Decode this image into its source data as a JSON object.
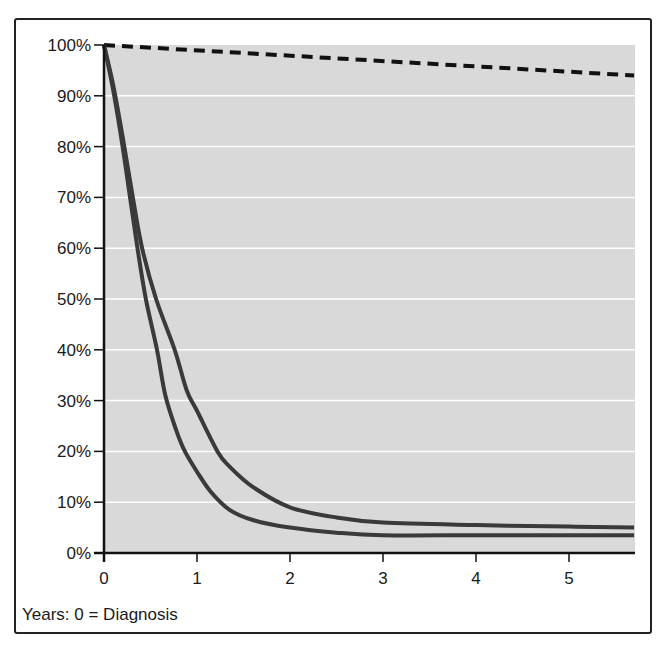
{
  "chart_data": {
    "type": "line",
    "title": "",
    "xlabel": "Years: 0 = Diagnosis",
    "ylabel": "",
    "xlim": [
      0,
      5.7
    ],
    "ylim": [
      0,
      100
    ],
    "x_ticks": [
      0,
      1,
      2,
      3,
      4,
      5
    ],
    "x_tick_labels": [
      "0",
      "1",
      "2",
      "3",
      "4",
      "5"
    ],
    "y_ticks": [
      0,
      10,
      20,
      30,
      40,
      50,
      60,
      70,
      80,
      90,
      100
    ],
    "y_tick_labels": [
      "0%",
      "10%",
      "20%",
      "30%",
      "40%",
      "50%",
      "60%",
      "70%",
      "80%",
      "90%",
      "100%"
    ],
    "grid": {
      "horizontal": true,
      "vertical": false,
      "color": "#ffffff"
    },
    "legend": null,
    "plot_background": "#d9d9d9",
    "series": [
      {
        "name": "reference (dashed)",
        "style": "dashed",
        "color": "#111111",
        "x": [
          0,
          5.7
        ],
        "y": [
          100,
          94
        ]
      },
      {
        "name": "upper curve",
        "style": "solid",
        "color": "#3a3a3a",
        "x": [
          0,
          0.1,
          0.2,
          0.31,
          0.41,
          0.56,
          0.76,
          0.89,
          1.0,
          1.22,
          1.35,
          1.6,
          2.0,
          2.5,
          3.0,
          4.0,
          5.0,
          5.7
        ],
        "y": [
          100,
          92,
          82,
          70,
          60,
          50,
          40,
          32,
          28,
          20,
          17,
          13,
          9,
          7,
          6,
          5.5,
          5.2,
          5
        ]
      },
      {
        "name": "lower curve",
        "style": "solid",
        "color": "#3a3a3a",
        "x": [
          0,
          0.1,
          0.2,
          0.28,
          0.36,
          0.45,
          0.57,
          0.66,
          0.78,
          0.87,
          1.0,
          1.15,
          1.35,
          1.6,
          2.0,
          2.5,
          3.0,
          4.0,
          5.0,
          5.7
        ],
        "y": [
          100,
          91,
          80,
          70,
          60,
          50,
          40,
          31,
          24,
          20,
          16,
          12,
          8.5,
          6.5,
          5,
          4,
          3.5,
          3.5,
          3.5,
          3.5
        ]
      }
    ]
  }
}
